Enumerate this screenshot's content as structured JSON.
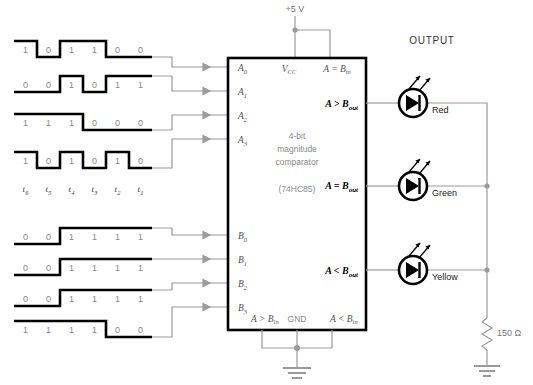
{
  "supply": {
    "label": "+5 V"
  },
  "output_header": "OUTPUT",
  "timing_labels": [
    "t6",
    "t5",
    "t4",
    "t3",
    "t2",
    "t1"
  ],
  "timing_labels_formatted": [
    {
      "base": "t",
      "sub": "6"
    },
    {
      "base": "t",
      "sub": "5"
    },
    {
      "base": "t",
      "sub": "4"
    },
    {
      "base": "t",
      "sub": "3"
    },
    {
      "base": "t",
      "sub": "2"
    },
    {
      "base": "t",
      "sub": "1"
    }
  ],
  "waveforms_a": [
    {
      "name": "A0",
      "pin_base": "A",
      "pin_sub": "0",
      "bits": [
        1,
        0,
        1,
        1,
        0,
        0
      ]
    },
    {
      "name": "A1",
      "pin_base": "A",
      "pin_sub": "1",
      "bits": [
        0,
        0,
        1,
        0,
        1,
        1
      ]
    },
    {
      "name": "A2",
      "pin_base": "A",
      "pin_sub": "2",
      "bits": [
        1,
        1,
        1,
        0,
        0,
        0
      ]
    },
    {
      "name": "A3",
      "pin_base": "A",
      "pin_sub": "3",
      "bits": [
        1,
        0,
        1,
        0,
        1,
        0
      ]
    }
  ],
  "waveforms_b": [
    {
      "name": "B0",
      "pin_base": "B",
      "pin_sub": "0",
      "bits": [
        0,
        0,
        1,
        1,
        1,
        1
      ]
    },
    {
      "name": "B1",
      "pin_base": "B",
      "pin_sub": "1",
      "bits": [
        0,
        0,
        1,
        1,
        1,
        1
      ]
    },
    {
      "name": "B2",
      "pin_base": "B",
      "pin_sub": "2",
      "bits": [
        0,
        0,
        1,
        1,
        1,
        1
      ]
    },
    {
      "name": "B3",
      "pin_base": "B",
      "pin_sub": "3",
      "bits": [
        1,
        1,
        1,
        1,
        0,
        0
      ]
    }
  ],
  "chip": {
    "line1": "4-bit",
    "line2": "magnitude",
    "line3": "comparator",
    "part_number": "(74HC85)",
    "vcc_base": "V",
    "vcc_sub": "CC",
    "ab_in_base": "A = B",
    "ab_in_sub": "in",
    "gnd_label": "GND",
    "a_gt_b_in_base": "A > B",
    "a_gt_b_in_sub": "in",
    "a_lt_b_in_base": "A < B",
    "a_lt_b_in_sub": "in",
    "outputs": [
      {
        "base": "A > B",
        "sub": "out"
      },
      {
        "base": "A = B",
        "sub": "out"
      },
      {
        "base": "A < B",
        "sub": "out"
      }
    ]
  },
  "leds": [
    {
      "name": "Red",
      "color": "#cc2222"
    },
    {
      "name": "Green",
      "color": "#22aa44"
    },
    {
      "name": "Yellow",
      "color": "#ccbb22"
    }
  ],
  "resistor": {
    "value": "150 Ω"
  },
  "colors": {
    "wire": "#9a9a9a",
    "signal": "#000000",
    "chip_text": "#8a8a8a"
  }
}
